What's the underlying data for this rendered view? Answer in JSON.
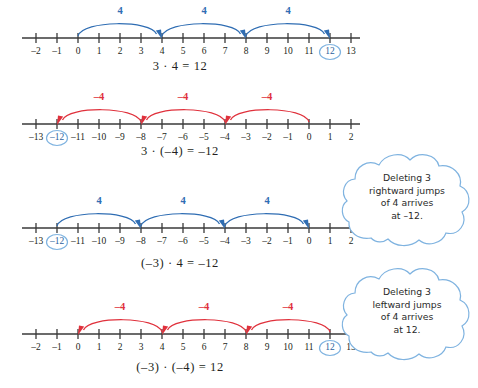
{
  "figure": {
    "colors": {
      "axis": "#3a3a3a",
      "blue": "#2f6db3",
      "red": "#e0313c",
      "text": "#231f20",
      "cloud_outline": "#7fb3e0"
    }
  },
  "numberlines": [
    {
      "id": "line-1",
      "equation": "3 · 4 = 12",
      "arc_color": "blue",
      "arc_direction": "right",
      "ticks": [
        {
          "value": -2,
          "label": "–2",
          "circled": false
        },
        {
          "value": -1,
          "label": "–1",
          "circled": false
        },
        {
          "value": 0,
          "label": "0",
          "circled": false
        },
        {
          "value": 1,
          "label": "1",
          "circled": false
        },
        {
          "value": 2,
          "label": "2",
          "circled": false
        },
        {
          "value": 3,
          "label": "3",
          "circled": false
        },
        {
          "value": 4,
          "label": "4",
          "circled": false
        },
        {
          "value": 5,
          "label": "5",
          "circled": false
        },
        {
          "value": 6,
          "label": "6",
          "circled": false
        },
        {
          "value": 7,
          "label": "7",
          "circled": false
        },
        {
          "value": 8,
          "label": "8",
          "circled": false
        },
        {
          "value": 9,
          "label": "9",
          "circled": false
        },
        {
          "value": 10,
          "label": "10",
          "circled": false
        },
        {
          "value": 11,
          "label": "11",
          "circled": false
        },
        {
          "value": 12,
          "label": "12",
          "circled": true
        },
        {
          "value": 13,
          "label": "13",
          "circled": false
        }
      ],
      "arcs": [
        {
          "from": 0,
          "to": 4,
          "label": "4"
        },
        {
          "from": 4,
          "to": 8,
          "label": "4"
        },
        {
          "from": 8,
          "to": 12,
          "label": "4"
        }
      ]
    },
    {
      "id": "line-2",
      "equation": "3 · (–4) = –12",
      "arc_color": "red",
      "arc_direction": "left",
      "ticks": [
        {
          "value": -13,
          "label": "–13",
          "circled": false
        },
        {
          "value": -12,
          "label": "–12",
          "circled": true
        },
        {
          "value": -11,
          "label": "–11",
          "circled": false
        },
        {
          "value": -10,
          "label": "–10",
          "circled": false
        },
        {
          "value": -9,
          "label": "–9",
          "circled": false
        },
        {
          "value": -8,
          "label": "–8",
          "circled": false
        },
        {
          "value": -7,
          "label": "–7",
          "circled": false
        },
        {
          "value": -6,
          "label": "–6",
          "circled": false
        },
        {
          "value": -5,
          "label": "–5",
          "circled": false
        },
        {
          "value": -4,
          "label": "–4",
          "circled": false
        },
        {
          "value": -3,
          "label": "–3",
          "circled": false
        },
        {
          "value": -2,
          "label": "–2",
          "circled": false
        },
        {
          "value": -1,
          "label": "–1",
          "circled": false
        },
        {
          "value": 0,
          "label": "0",
          "circled": false
        },
        {
          "value": 1,
          "label": "1",
          "circled": false
        },
        {
          "value": 2,
          "label": "2",
          "circled": false
        }
      ],
      "arcs": [
        {
          "from": 0,
          "to": -4,
          "label": "–4"
        },
        {
          "from": -4,
          "to": -8,
          "label": "–4"
        },
        {
          "from": -8,
          "to": -12,
          "label": "–4"
        }
      ]
    },
    {
      "id": "line-3",
      "equation": "(–3) · 4 = –12",
      "arc_color": "blue",
      "arc_direction": "right",
      "ticks": [
        {
          "value": -13,
          "label": "–13",
          "circled": false
        },
        {
          "value": -12,
          "label": "–12",
          "circled": true
        },
        {
          "value": -11,
          "label": "–11",
          "circled": false
        },
        {
          "value": -10,
          "label": "–10",
          "circled": false
        },
        {
          "value": -9,
          "label": "–9",
          "circled": false
        },
        {
          "value": -8,
          "label": "–8",
          "circled": false
        },
        {
          "value": -7,
          "label": "–7",
          "circled": false
        },
        {
          "value": -6,
          "label": "–6",
          "circled": false
        },
        {
          "value": -5,
          "label": "–5",
          "circled": false
        },
        {
          "value": -4,
          "label": "–4",
          "circled": false
        },
        {
          "value": -3,
          "label": "–3",
          "circled": false
        },
        {
          "value": -2,
          "label": "–2",
          "circled": false
        },
        {
          "value": -1,
          "label": "–1",
          "circled": false
        },
        {
          "value": 0,
          "label": "0",
          "circled": false
        },
        {
          "value": 1,
          "label": "1",
          "circled": false
        },
        {
          "value": 2,
          "label": "2",
          "circled": false
        }
      ],
      "arcs": [
        {
          "from": -12,
          "to": -8,
          "label": "4"
        },
        {
          "from": -8,
          "to": -4,
          "label": "4"
        },
        {
          "from": -4,
          "to": 0,
          "label": "4"
        }
      ]
    },
    {
      "id": "line-4",
      "equation": "(–3) · (–4) = 12",
      "arc_color": "red",
      "arc_direction": "left",
      "ticks": [
        {
          "value": -2,
          "label": "–2",
          "circled": false
        },
        {
          "value": -1,
          "label": "–1",
          "circled": false
        },
        {
          "value": 0,
          "label": "0",
          "circled": false
        },
        {
          "value": 1,
          "label": "1",
          "circled": false
        },
        {
          "value": 2,
          "label": "2",
          "circled": false
        },
        {
          "value": 3,
          "label": "3",
          "circled": false
        },
        {
          "value": 4,
          "label": "4",
          "circled": false
        },
        {
          "value": 5,
          "label": "5",
          "circled": false
        },
        {
          "value": 6,
          "label": "6",
          "circled": false
        },
        {
          "value": 7,
          "label": "7",
          "circled": false
        },
        {
          "value": 8,
          "label": "8",
          "circled": false
        },
        {
          "value": 9,
          "label": "9",
          "circled": false
        },
        {
          "value": 10,
          "label": "10",
          "circled": false
        },
        {
          "value": 11,
          "label": "11",
          "circled": false
        },
        {
          "value": 12,
          "label": "12",
          "circled": true
        },
        {
          "value": 13,
          "label": "13",
          "circled": false
        }
      ],
      "arcs": [
        {
          "from": 4,
          "to": 0,
          "label": "–4"
        },
        {
          "from": 8,
          "to": 4,
          "label": "–4"
        },
        {
          "from": 12,
          "to": 8,
          "label": "–4"
        }
      ]
    }
  ],
  "callouts": [
    {
      "id": "callout-1",
      "lines": [
        "Deleting 3",
        "rightward jumps",
        "of 4 arrives",
        "at –12."
      ]
    },
    {
      "id": "callout-2",
      "lines": [
        "Deleting 3",
        "leftward jumps",
        "of 4 arrives",
        "at 12."
      ]
    }
  ]
}
